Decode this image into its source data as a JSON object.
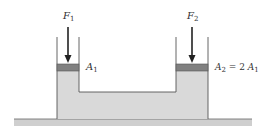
{
  "diagram": {
    "type": "hydraulic-press",
    "labels": {
      "force_left": {
        "symbol": "F",
        "subscript": "1"
      },
      "force_right": {
        "symbol": "F",
        "subscript": "2"
      },
      "area_left": {
        "symbol": "A",
        "subscript": "1"
      },
      "area_right": {
        "symbol": "A",
        "subscript": "2",
        "relation": "= 2",
        "ref_symbol": "A",
        "ref_subscript": "1"
      }
    },
    "colors": {
      "fluid": "#d9d9d9",
      "piston": "#808080",
      "ground": "#cfcfcf",
      "stroke": "#555555",
      "arrow": "#222222"
    }
  }
}
